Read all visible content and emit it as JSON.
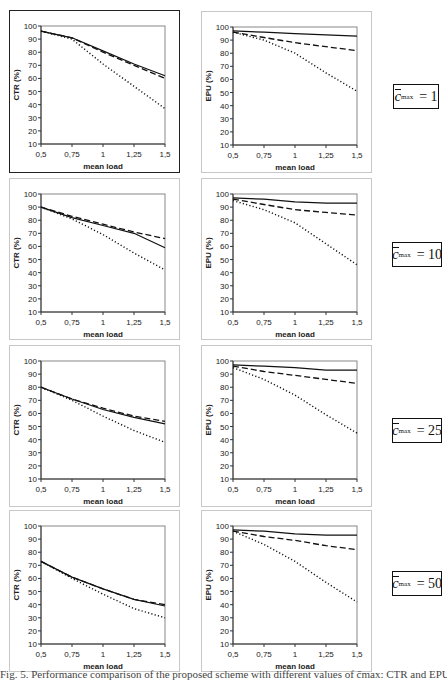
{
  "figure": {
    "caption": "Fig. 5. Performance comparison of the proposed scheme with different values of c̄max: CTR and EPU"
  },
  "x_axis": {
    "label": "mean load",
    "ticks": [
      "0,5",
      "0,75",
      "1",
      "1,25",
      "1,5"
    ],
    "range": [
      0.5,
      1.5
    ]
  },
  "y_ticks": [
    "100",
    "90",
    "80",
    "70",
    "60",
    "50",
    "40",
    "30",
    "20",
    "10"
  ],
  "rows": [
    {
      "label": {
        "var": "c",
        "sub": "max",
        "eq": "= 1"
      }
    },
    {
      "label": {
        "var": "c",
        "sub": "max",
        "eq": "= 10"
      }
    },
    {
      "label": {
        "var": "c",
        "sub": "max",
        "eq": "= 25"
      }
    },
    {
      "label": {
        "var": "c",
        "sub": "max",
        "eq": "= 50"
      }
    }
  ],
  "chart_data": [
    {
      "type": "line",
      "title": "CTR, c̄max = 1",
      "xlabel": "mean load",
      "ylabel": "CTR (%)",
      "ylim": [
        10,
        100
      ],
      "x": [
        0.5,
        0.75,
        1.0,
        1.25,
        1.5
      ],
      "series": [
        {
          "name": "solid",
          "style": "solid",
          "values": [
            96,
            91,
            81,
            71,
            62
          ]
        },
        {
          "name": "dashed",
          "style": "dashed",
          "values": [
            96,
            91,
            80,
            70,
            60
          ]
        },
        {
          "name": "dotted",
          "style": "dotted",
          "values": [
            96,
            90,
            71,
            54,
            37
          ]
        }
      ]
    },
    {
      "type": "line",
      "title": "EPU, c̄max = 1",
      "xlabel": "mean load",
      "ylabel": "EPU (%)",
      "ylim": [
        10,
        100
      ],
      "x": [
        0.5,
        0.75,
        1.0,
        1.25,
        1.5
      ],
      "series": [
        {
          "name": "solid",
          "style": "solid",
          "values": [
            97,
            96,
            95,
            94,
            93
          ]
        },
        {
          "name": "dashed",
          "style": "dashed",
          "values": [
            96,
            92,
            88,
            85,
            82
          ]
        },
        {
          "name": "dotted",
          "style": "dotted",
          "values": [
            96,
            90,
            80,
            65,
            51
          ]
        }
      ]
    },
    {
      "type": "line",
      "title": "CTR, c̄max = 10",
      "xlabel": "mean load",
      "ylabel": "CTR (%)",
      "ylim": [
        10,
        100
      ],
      "x": [
        0.5,
        0.75,
        1.0,
        1.25,
        1.5
      ],
      "series": [
        {
          "name": "solid",
          "style": "solid",
          "values": [
            90,
            82,
            76,
            70,
            59
          ]
        },
        {
          "name": "dashed",
          "style": "dashed",
          "values": [
            90,
            83,
            77,
            71,
            66
          ]
        },
        {
          "name": "dotted",
          "style": "dotted",
          "values": [
            90,
            81,
            69,
            55,
            42
          ]
        }
      ]
    },
    {
      "type": "line",
      "title": "EPU, c̄max = 10",
      "xlabel": "mean load",
      "ylabel": "EPU (%)",
      "ylim": [
        10,
        100
      ],
      "x": [
        0.5,
        0.75,
        1.0,
        1.25,
        1.5
      ],
      "series": [
        {
          "name": "solid",
          "style": "solid",
          "values": [
            97,
            96,
            94,
            93,
            93
          ]
        },
        {
          "name": "dashed",
          "style": "dashed",
          "values": [
            96,
            92,
            88,
            86,
            84
          ]
        },
        {
          "name": "dotted",
          "style": "dotted",
          "values": [
            95,
            88,
            78,
            62,
            46
          ]
        }
      ]
    },
    {
      "type": "line",
      "title": "CTR, c̄max = 25",
      "xlabel": "mean load",
      "ylabel": "CTR (%)",
      "ylim": [
        10,
        100
      ],
      "x": [
        0.5,
        0.75,
        1.0,
        1.25,
        1.5
      ],
      "series": [
        {
          "name": "solid",
          "style": "solid",
          "values": [
            80,
            71,
            63,
            57,
            52
          ]
        },
        {
          "name": "dashed",
          "style": "dashed",
          "values": [
            80,
            71,
            64,
            58,
            54
          ]
        },
        {
          "name": "dotted",
          "style": "dotted",
          "values": [
            80,
            70,
            58,
            47,
            38
          ]
        }
      ]
    },
    {
      "type": "line",
      "title": "EPU, c̄max = 25",
      "xlabel": "mean load",
      "ylabel": "EPU (%)",
      "ylim": [
        10,
        100
      ],
      "x": [
        0.5,
        0.75,
        1.0,
        1.25,
        1.5
      ],
      "series": [
        {
          "name": "solid",
          "style": "solid",
          "values": [
            97,
            96,
            95,
            93,
            93
          ]
        },
        {
          "name": "dashed",
          "style": "dashed",
          "values": [
            96,
            92,
            89,
            86,
            83
          ]
        },
        {
          "name": "dotted",
          "style": "dotted",
          "values": [
            95,
            86,
            74,
            59,
            45
          ]
        }
      ]
    },
    {
      "type": "line",
      "title": "CTR, c̄max = 50",
      "xlabel": "mean load",
      "ylabel": "CTR (%)",
      "ylim": [
        10,
        100
      ],
      "x": [
        0.5,
        0.75,
        1.0,
        1.25,
        1.5
      ],
      "series": [
        {
          "name": "solid",
          "style": "solid",
          "values": [
            73,
            61,
            52,
            44,
            39
          ]
        },
        {
          "name": "dashed",
          "style": "dashed",
          "values": [
            73,
            61,
            52,
            44,
            40
          ]
        },
        {
          "name": "dotted",
          "style": "dotted",
          "values": [
            73,
            60,
            48,
            37,
            30
          ]
        }
      ]
    },
    {
      "type": "line",
      "title": "EPU, c̄max = 50",
      "xlabel": "mean load",
      "ylabel": "EPU (%)",
      "ylim": [
        10,
        100
      ],
      "x": [
        0.5,
        0.75,
        1.0,
        1.25,
        1.5
      ],
      "series": [
        {
          "name": "solid",
          "style": "solid",
          "values": [
            97,
            96,
            94,
            93,
            93
          ]
        },
        {
          "name": "dashed",
          "style": "dashed",
          "values": [
            96,
            92,
            89,
            85,
            82
          ]
        },
        {
          "name": "dotted",
          "style": "dotted",
          "values": [
            96,
            86,
            73,
            57,
            42
          ]
        }
      ]
    }
  ]
}
